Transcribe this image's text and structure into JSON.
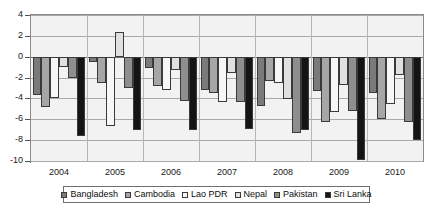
{
  "chart_data": {
    "type": "bar",
    "title": "",
    "subtitle": "",
    "xlabel": "",
    "ylabel": "",
    "categories": [
      "2004",
      "2005",
      "2006",
      "2007",
      "2008",
      "2009",
      "2010"
    ],
    "ylim": [
      -10,
      4
    ],
    "yticks": [
      4,
      2,
      0,
      -2,
      -4,
      -6,
      -8,
      -10
    ],
    "ytick_labels": [
      "4",
      "2",
      "0",
      "-2",
      "-4",
      "-6",
      "-8",
      "-10"
    ],
    "grid": true,
    "legend_position": "bottom",
    "series": [
      {
        "name": "Bangladesh",
        "color": "#7a7a7a",
        "values": [
          -3.7,
          -0.5,
          -1.1,
          -3.2,
          -4.7,
          -3.3,
          -3.5
        ]
      },
      {
        "name": "Cambodia",
        "color": "#a6a6a6",
        "values": [
          -4.8,
          -2.5,
          -2.8,
          -3.5,
          -2.3,
          -6.3,
          -6.0
        ]
      },
      {
        "name": "Lao PDR",
        "color": "#f7f7f7",
        "values": [
          -4.0,
          -6.6,
          -3.2,
          -4.3,
          -2.5,
          -5.3,
          -4.5
        ]
      },
      {
        "name": "Nepal",
        "color": "#e0e0e0",
        "values": [
          -1.0,
          2.4,
          -1.3,
          -1.6,
          -4.1,
          -2.7,
          -1.8
        ]
      },
      {
        "name": "Pakistan",
        "color": "#8e8e8e",
        "values": [
          -2.0,
          -3.0,
          -4.2,
          -4.3,
          -7.3,
          -5.2,
          -6.3
        ]
      },
      {
        "name": "Sri Lanka",
        "color": "#141414",
        "values": [
          -7.6,
          -7.0,
          -7.0,
          -6.9,
          -7.0,
          -9.9,
          -8.0
        ]
      }
    ]
  }
}
